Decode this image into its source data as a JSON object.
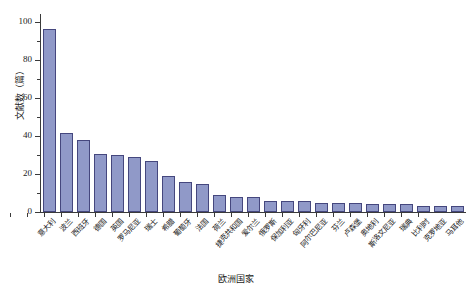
{
  "chart_data": {
    "type": "bar",
    "title": "",
    "xlabel": "欧洲国家",
    "ylabel": "文献数（篇）",
    "ylim": [
      0,
      105
    ],
    "yticks": [
      0,
      20,
      40,
      60,
      80,
      100
    ],
    "ytick_labels": [
      "0",
      "20",
      "40",
      "60",
      "80",
      "100"
    ],
    "grid": false,
    "legend": null,
    "bar_color": "#9099c8",
    "bar_edge_color": "#45477e",
    "axis_color": "#3a3a3a",
    "categories": [
      "意大利",
      "波兰",
      "西班牙",
      "德国",
      "英国",
      "罗马尼亚",
      "瑞士",
      "希腊",
      "葡萄牙",
      "法国",
      "荷兰",
      "捷克共和国",
      "爱尔兰",
      "俄罗斯",
      "保加利亚",
      "匈牙利",
      "阿尔巴尼亚",
      "芬兰",
      "卢森堡",
      "奥地利",
      "斯洛文尼亚",
      "瑞典",
      "比利时",
      "克罗地亚",
      "马耳他"
    ],
    "values": [
      97,
      42,
      38,
      31,
      30,
      29,
      27,
      19,
      16,
      15,
      9,
      8,
      8,
      6,
      6,
      6,
      5,
      5,
      5,
      4,
      4,
      4,
      3,
      3,
      3
    ]
  }
}
